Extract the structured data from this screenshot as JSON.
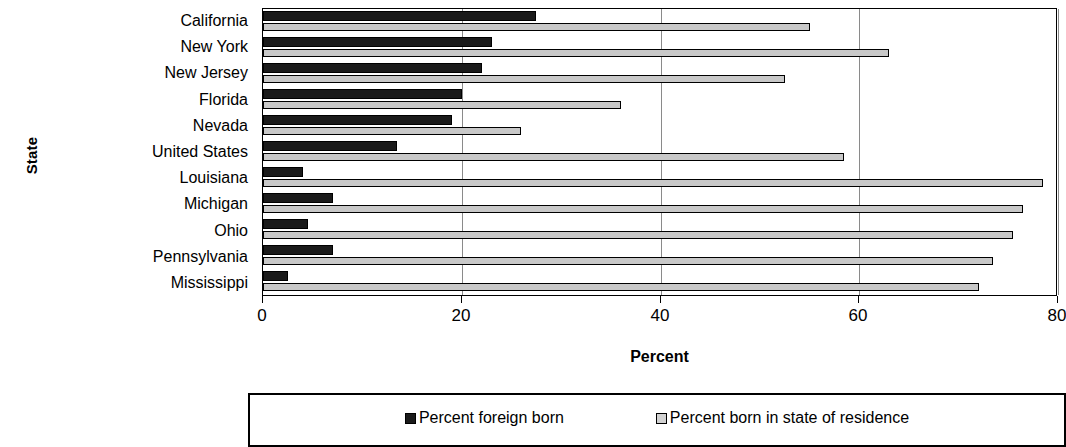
{
  "chart_data": {
    "type": "bar",
    "orientation": "horizontal",
    "title": "",
    "xlabel": "Percent",
    "ylabel": "State",
    "xlim": [
      0,
      80
    ],
    "xticks": [
      0,
      20,
      40,
      60,
      80
    ],
    "xtick_labels": [
      "0",
      "20",
      "40",
      "60",
      "80"
    ],
    "grid": true,
    "grid_axis": "x",
    "legend_position": "bottom",
    "categories": [
      "California",
      "New York",
      "New Jersey",
      "Florida",
      "Nevada",
      "United States",
      "Louisiana",
      "Michigan",
      "Ohio",
      "Pennsylvania",
      "Mississippi"
    ],
    "series": [
      {
        "name": "Percent foreign born",
        "color": "#1a1a1a",
        "values": [
          27.5,
          23.0,
          22.0,
          20.0,
          19.0,
          13.5,
          4.0,
          7.0,
          4.5,
          7.0,
          2.5
        ]
      },
      {
        "name": "Percent born in state of residence",
        "color": "#c8c8c8",
        "values": [
          55.0,
          63.0,
          52.5,
          36.0,
          26.0,
          58.5,
          78.5,
          76.5,
          75.5,
          73.5,
          72.0
        ]
      }
    ]
  },
  "axes": {
    "y_title": "State",
    "x_title": "Percent"
  },
  "legend": {
    "items": [
      {
        "label": "Percent foreign born",
        "swatch": "foreign"
      },
      {
        "label": "Percent born in state of residence",
        "swatch": "instate"
      }
    ]
  }
}
